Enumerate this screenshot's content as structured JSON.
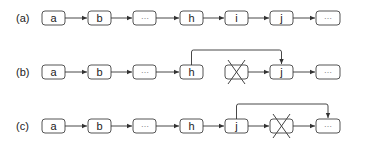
{
  "diagram": {
    "rows": [
      {
        "label": "(a)",
        "nodes": [
          "a",
          "b",
          "⋯",
          "h",
          "i",
          "j",
          "⋯"
        ],
        "removed_index": null,
        "bypass": null
      },
      {
        "label": "(b)",
        "nodes": [
          "a",
          "b",
          "⋯",
          "h",
          "",
          "j",
          "⋯"
        ],
        "removed_index": 4,
        "bypass": {
          "from": "h",
          "to": "j"
        }
      },
      {
        "label": "(c)",
        "nodes": [
          "a",
          "b",
          "⋯",
          "h",
          "j",
          "",
          "⋯"
        ],
        "removed_index": 5,
        "bypass": {
          "from": "j",
          "to": "⋯"
        }
      }
    ]
  }
}
